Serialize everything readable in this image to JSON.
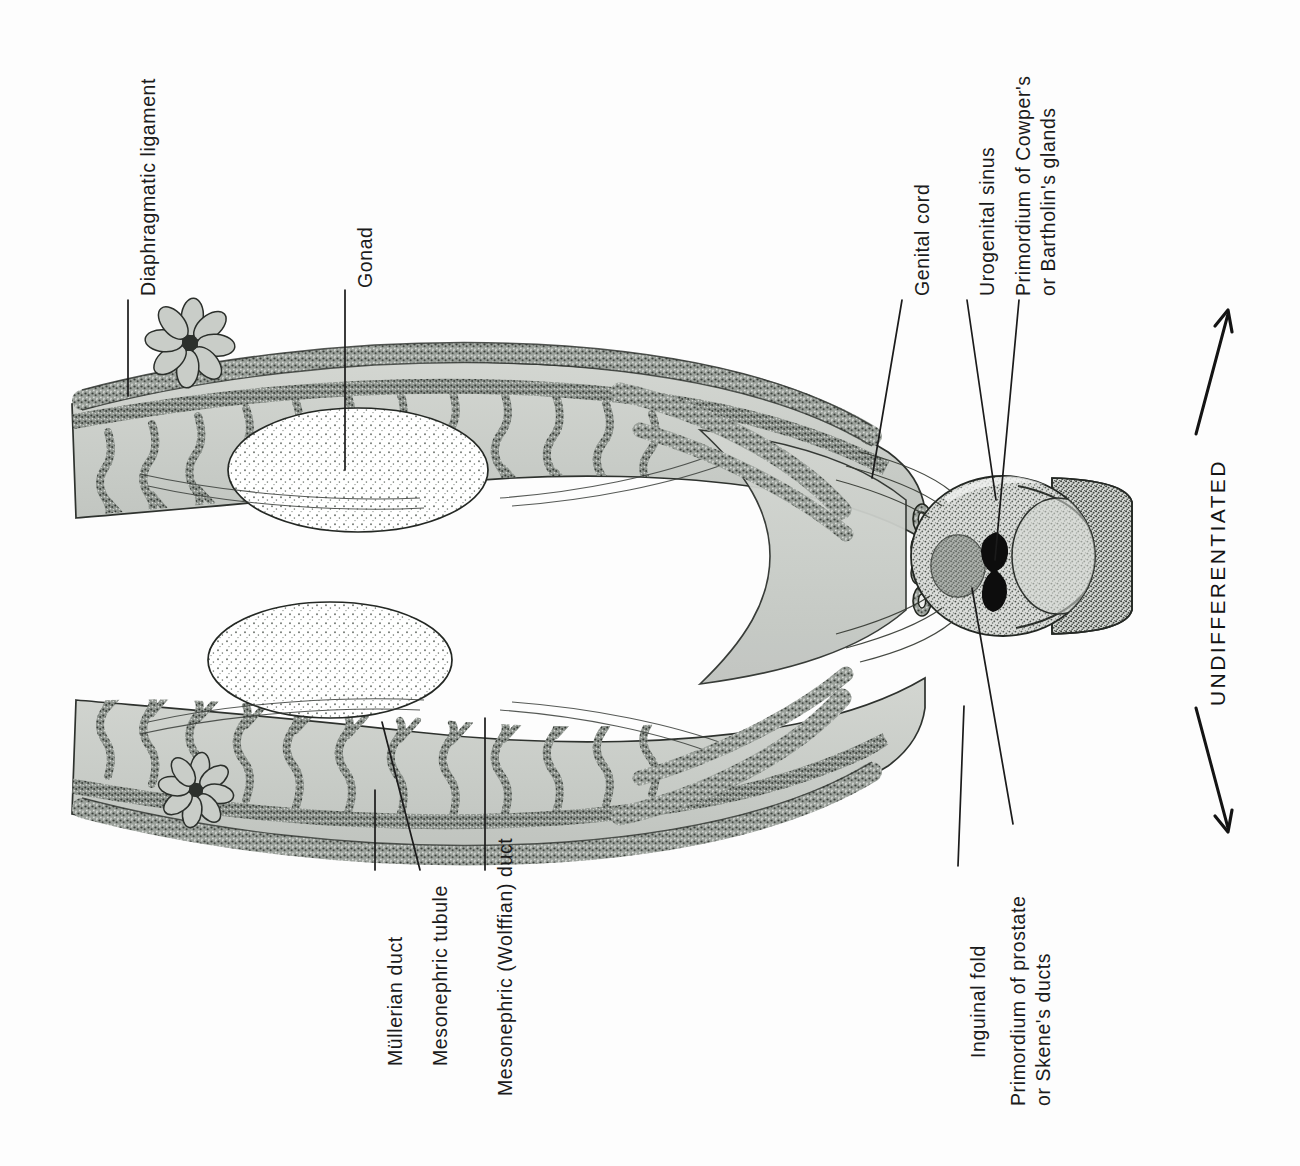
{
  "figure": {
    "stage_caption": "UNDIFFERENTIATED",
    "orientation": "rotated-labels",
    "background_color": "#fdfdfd",
    "ink_color": "#1b1b1b",
    "tissue_fill": "#c9cdc9",
    "tissue_fill_light": "#d8dbd6",
    "stipple_color": "#5d625d",
    "lumen_color": "#0d0d0d"
  },
  "labels": {
    "diaphragmatic_ligament": "Diaphragmatic ligament",
    "gonad": "Gonad",
    "genital_cord": "Genital cord",
    "urogenital_sinus": "Urogenital sinus",
    "cowper_line1": "Primordium of Cowper's",
    "cowper_line2": "or Bartholin's glands",
    "mullerian_duct": "Müllerian duct",
    "mesonephric_tubule": "Mesonephric tubule",
    "mesonephric_wolffian_duct": "Mesonephric (Wolffian) duct",
    "inguinal_fold": "Inguinal fold",
    "prostate_line1": "Primordium of prostate",
    "prostate_line2": "or Skene's ducts"
  },
  "structures": [
    {
      "name": "diaphragmatic-ligament",
      "side": "upper-left",
      "description": "fimbriated rosette at cranial tip of duct"
    },
    {
      "name": "gonad",
      "side": "upper",
      "description": "pale stippled ovoid gonadal ridge"
    },
    {
      "name": "gonad",
      "side": "lower",
      "description": "pale stippled ovoid gonadal ridge"
    },
    {
      "name": "mesonephric-tubule",
      "side": "both",
      "description": "wavy branching tubules along mesonephros"
    },
    {
      "name": "mullerian-duct",
      "side": "both",
      "description": "outer longitudinal duct"
    },
    {
      "name": "mesonephric-wolffian-duct",
      "side": "both",
      "description": "inner longitudinal duct"
    },
    {
      "name": "genital-cord",
      "side": "center",
      "description": "fused ducts entering pelvis"
    },
    {
      "name": "urogenital-sinus",
      "side": "center",
      "description": "bulbous sinus with dark lumen"
    },
    {
      "name": "cowper-bartholin-primordium",
      "side": "center",
      "description": "grey ovoid gland bud"
    },
    {
      "name": "prostate-skene-primordium",
      "side": "center",
      "description": "bud adjacent to sinus lumen"
    },
    {
      "name": "inguinal-fold",
      "side": "lower-center",
      "description": "fold sweeping caudally"
    }
  ],
  "arrows": {
    "up": "arrow-up",
    "down": "arrow-down"
  }
}
